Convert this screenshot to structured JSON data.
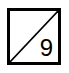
{
  "tile": {
    "number": "9",
    "border_color": "#000000",
    "background": "#ffffff",
    "diagonal": "bottom-left-to-top-right"
  }
}
